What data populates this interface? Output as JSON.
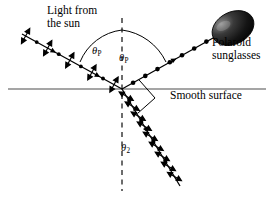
{
  "figure": {
    "background_color": "#ffffff",
    "stroke_color": "#000000",
    "width": 274,
    "height": 198
  },
  "labels": {
    "light_from_sun": "Light from\nthe sun",
    "polaroid_sunglasses": "Polaroid\nsunglasses",
    "smooth_surface": "Smooth surface",
    "theta_p_left_symbol": "θ",
    "theta_p_left_sub": "P",
    "theta_p_right_symbol": "θ",
    "theta_p_right_sub": "P",
    "theta_2_symbol": "θ",
    "theta_2_sub": "2"
  },
  "elements": {
    "surface_line": "horizontal smooth surface boundary",
    "normal_line": "vertical dashed normal",
    "incident_ray": "unpolarized light from the sun",
    "reflected_ray": "polarized reflected ray toward sunglasses",
    "refracted_ray": "partially polarized refracted ray",
    "right_angle_marker": "90 degree marker between reflected and refracted rays",
    "sunglasses_lens": "dark elliptical Polaroid lens"
  },
  "geometry": {
    "origin_x": 122,
    "origin_y": 89,
    "surface_y": 89,
    "normal_top_y": 18,
    "normal_bottom_y": 191,
    "incident_start_x": 22,
    "incident_start_y": 34,
    "reflected_end_x": 222,
    "reflected_end_y": 33,
    "refracted_end_x": 180,
    "refracted_end_y": 186
  },
  "colors": {
    "ink": "#000000",
    "surface": "#555555",
    "lens_dark": "#0d0d0d",
    "lens_mid": "#4a4a4a",
    "lens_light": "#8f8f8f"
  }
}
